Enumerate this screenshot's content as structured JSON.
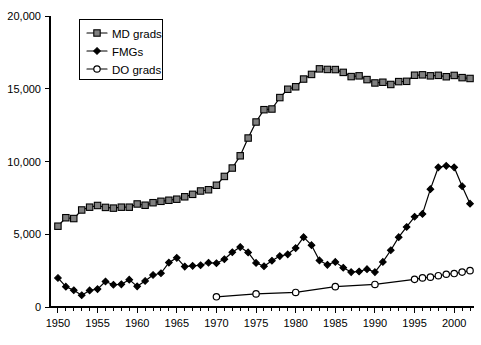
{
  "chart_data": {
    "type": "line",
    "title": "",
    "subtitle": "",
    "xlabel": "",
    "ylabel": "",
    "xlim": [
      1949,
      2002.5
    ],
    "ylim": [
      0,
      20000
    ],
    "grid": false,
    "legend_position": "top-left",
    "y_ticks": [
      0,
      5000,
      10000,
      15000,
      20000
    ],
    "y_tick_labels": [
      "0",
      "5,000",
      "10,000",
      "15,000",
      "20,000"
    ],
    "x_ticks": [
      1950,
      1951,
      1952,
      1953,
      1954,
      1955,
      1956,
      1957,
      1958,
      1959,
      1960,
      1961,
      1962,
      1963,
      1964,
      1965,
      1966,
      1967,
      1968,
      1969,
      1970,
      1971,
      1972,
      1973,
      1974,
      1975,
      1976,
      1977,
      1978,
      1979,
      1980,
      1981,
      1982,
      1983,
      1984,
      1985,
      1986,
      1987,
      1988,
      1989,
      1990,
      1991,
      1992,
      1993,
      1994,
      1995,
      1996,
      1997,
      1998,
      1999,
      2000,
      2001,
      2002
    ],
    "x_tick_labels": [
      {
        "value": 1950,
        "label": "1950"
      },
      {
        "value": 1955,
        "label": "1955"
      },
      {
        "value": 1960,
        "label": "1960"
      },
      {
        "value": 1965,
        "label": "1965"
      },
      {
        "value": 1970,
        "label": "1970"
      },
      {
        "value": 1975,
        "label": "1975"
      },
      {
        "value": 1980,
        "label": "1980"
      },
      {
        "value": 1985,
        "label": "1985"
      },
      {
        "value": 1990,
        "label": "1990"
      },
      {
        "value": 1995,
        "label": "1995"
      },
      {
        "value": 2000,
        "label": "2000"
      }
    ],
    "series": [
      {
        "name": "MD grads",
        "marker": "square",
        "marker_fill": "#808080",
        "color": "#000000",
        "x": [
          1950,
          1951,
          1952,
          1953,
          1954,
          1955,
          1956,
          1957,
          1958,
          1959,
          1960,
          1961,
          1962,
          1963,
          1964,
          1965,
          1966,
          1967,
          1968,
          1969,
          1970,
          1971,
          1972,
          1973,
          1974,
          1975,
          1976,
          1977,
          1978,
          1979,
          1980,
          1981,
          1982,
          1983,
          1984,
          1985,
          1986,
          1987,
          1988,
          1989,
          1990,
          1991,
          1992,
          1993,
          1994,
          1995,
          1996,
          1997,
          1998,
          1999,
          2000,
          2001,
          2002
        ],
        "values": [
          5553,
          6135,
          6080,
          6668,
          6861,
          6977,
          6845,
          6796,
          6861,
          6860,
          7081,
          6994,
          7168,
          7264,
          7336,
          7409,
          7574,
          7743,
          7973,
          8059,
          8367,
          8974,
          9551,
          10391,
          11613,
          12714,
          13561,
          13607,
          14393,
          14966,
          15135,
          15667,
          15985,
          16367,
          16327,
          16318,
          16125,
          15836,
          15887,
          15629,
          15398,
          15447,
          15294,
          15490,
          15511,
          15929,
          15956,
          15888,
          15922,
          15826,
          15916,
          15764,
          15706
        ]
      },
      {
        "name": "FMGs",
        "marker": "diamond",
        "marker_fill": "#000000",
        "color": "#000000",
        "x": [
          1950,
          1951,
          1952,
          1953,
          1954,
          1955,
          1956,
          1957,
          1958,
          1959,
          1960,
          1961,
          1962,
          1963,
          1964,
          1965,
          1966,
          1967,
          1968,
          1969,
          1970,
          1971,
          1972,
          1973,
          1974,
          1975,
          1976,
          1977,
          1978,
          1979,
          1980,
          1981,
          1982,
          1983,
          1984,
          1985,
          1986,
          1987,
          1988,
          1989,
          1990,
          1991,
          1992,
          1993,
          1994,
          1995,
          1996,
          1997,
          1998,
          1999,
          2000,
          2001,
          2002
        ],
        "values": [
          1995,
          1400,
          1150,
          810,
          1140,
          1230,
          1750,
          1530,
          1560,
          1880,
          1420,
          1790,
          2200,
          2320,
          3050,
          3380,
          2780,
          2830,
          2870,
          3040,
          3010,
          3280,
          3760,
          4120,
          3750,
          3030,
          2800,
          3180,
          3500,
          3620,
          4050,
          4800,
          4250,
          3200,
          2900,
          3100,
          2700,
          2400,
          2440,
          2600,
          2400,
          3100,
          3900,
          4800,
          5500,
          6200,
          6400,
          8100,
          9600,
          9700,
          9600,
          8300,
          7100
        ]
      },
      {
        "name": "DO grads",
        "marker": "circle",
        "marker_fill": "#ffffff",
        "color": "#000000",
        "x": [
          1970,
          1975,
          1980,
          1985,
          1990,
          1995,
          1996,
          1997,
          1998,
          1999,
          2000,
          2001,
          2002
        ],
        "values": [
          700,
          900,
          1000,
          1400,
          1550,
          1900,
          2000,
          2050,
          2150,
          2250,
          2300,
          2400,
          2500
        ]
      }
    ]
  },
  "legend": {
    "items": [
      {
        "label": "MD grads"
      },
      {
        "label": "FMGs"
      },
      {
        "label": "DO grads"
      }
    ]
  }
}
